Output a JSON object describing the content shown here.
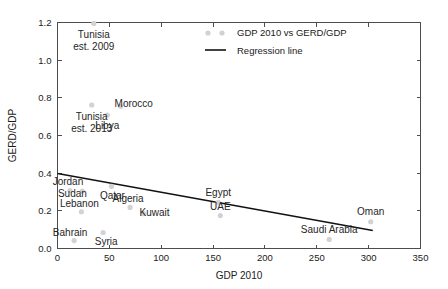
{
  "chart_data": {
    "type": "scatter",
    "title": "",
    "xlabel": "GDP 2010",
    "ylabel": "GERD/GDP",
    "xlim": [
      0,
      350
    ],
    "ylim": [
      0,
      1.2
    ],
    "xticks": [
      0,
      50,
      100,
      150,
      200,
      250,
      300,
      350
    ],
    "xtick_labels": [
      "0",
      "50",
      "100",
      "150",
      "200",
      "250",
      "300",
      "350"
    ],
    "yticks": [
      0.0,
      0.2,
      0.4,
      0.6,
      0.8,
      1.0,
      1.2
    ],
    "ytick_labels": [
      "0.0",
      "0.2",
      "0.4",
      "0.6",
      "0.8",
      "1.0",
      "1.2"
    ],
    "grid": false,
    "legend_position": "top-center-right",
    "series": [
      {
        "name": "GDP 2010 vs GERD/GDP",
        "marker_color": "#d2d2d2",
        "points": [
          {
            "label": "Tunisia\nest. 2009",
            "label_lines": [
              "Tunisia",
              "est. 2009"
            ],
            "x": 35,
            "y": 1.195
          },
          {
            "label": "Tunisia\nest. 2013",
            "label_lines": [
              "Tunisia",
              "est. 2013"
            ],
            "x": 33,
            "y": 0.762
          },
          {
            "label": "Morocco",
            "label_lines": [
              "Morocco"
            ],
            "x": 61,
            "y": 0.755
          },
          {
            "label": "Libya",
            "label_lines": [
              "Libya"
            ],
            "x": 48,
            "y": 0.708
          },
          {
            "label": "Jordan",
            "label_lines": [
              "Jordan"
            ],
            "x": 12,
            "y": 0.308
          },
          {
            "label": "Sudan",
            "label_lines": [
              "Sudan"
            ],
            "x": 24,
            "y": 0.305
          },
          {
            "label": "Qatar",
            "label_lines": [
              "Qatar"
            ],
            "x": 52,
            "y": 0.33
          },
          {
            "label": "Algeria",
            "label_lines": [
              "Algeria"
            ],
            "x": 70,
            "y": 0.218
          },
          {
            "label": "Kuwait",
            "label_lines": [
              "Kuwait"
            ],
            "x": 83,
            "y": 0.185
          },
          {
            "label": "Lebanon",
            "label_lines": [
              "Lebanon"
            ],
            "x": 23,
            "y": 0.195
          },
          {
            "label": "Bahrain",
            "label_lines": [
              "Bahrain"
            ],
            "x": 16,
            "y": 0.042
          },
          {
            "label": "Syria",
            "label_lines": [
              "Syria"
            ],
            "x": 44,
            "y": 0.085
          },
          {
            "label": "Egypt",
            "label_lines": [
              "Egypt"
            ],
            "x": 155,
            "y": 0.245
          },
          {
            "label": "UAE",
            "label_lines": [
              "UAE"
            ],
            "x": 157,
            "y": 0.175
          },
          {
            "label": "Saudi Arabia",
            "label_lines": [
              "Saudi Arabia"
            ],
            "x": 262,
            "y": 0.048
          },
          {
            "label": "Oman",
            "label_lines": [
              "Oman"
            ],
            "x": 302,
            "y": 0.142
          }
        ]
      }
    ],
    "regression": {
      "name": "Regression line",
      "color": "#121212",
      "x_start": 0,
      "y_start": 0.398,
      "x_end": 304,
      "y_end": 0.096
    },
    "legend_entries": [
      {
        "label": "GDP 2010 vs GERD/GDP",
        "type": "marker"
      },
      {
        "label": "Regression line",
        "type": "line"
      }
    ]
  }
}
